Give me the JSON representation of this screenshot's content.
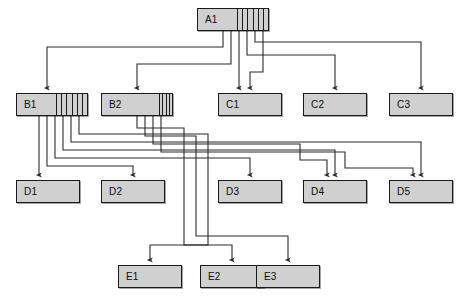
{
  "diagram": {
    "background_color": "#ffffff",
    "node_fill": "#d0d0d0",
    "node_stroke": "#1a1a1a",
    "edge_color": "#2b2b2b",
    "levels": [
      "A",
      "B",
      "C",
      "D",
      "E"
    ],
    "nodes": [
      {
        "id": "A1",
        "label": "A1",
        "x": 197,
        "y": 8,
        "w": 72,
        "h": 23,
        "ports": 6,
        "label_w": 26
      },
      {
        "id": "B1",
        "label": "B1",
        "x": 16,
        "y": 93,
        "w": 72,
        "h": 23,
        "ports": 6,
        "label_w": 26
      },
      {
        "id": "B2",
        "label": "B2",
        "x": 101,
        "y": 93,
        "w": 72,
        "h": 23,
        "ports": 4,
        "label_w": 44
      },
      {
        "id": "C1",
        "label": "C1",
        "x": 218,
        "y": 93,
        "w": 64,
        "h": 23,
        "ports": 0,
        "label_w": 0
      },
      {
        "id": "C2",
        "label": "C2",
        "x": 303,
        "y": 93,
        "w": 64,
        "h": 23,
        "ports": 0,
        "label_w": 0
      },
      {
        "id": "C3",
        "label": "C3",
        "x": 389,
        "y": 93,
        "w": 64,
        "h": 23,
        "ports": 0,
        "label_w": 0
      },
      {
        "id": "D1",
        "label": "D1",
        "x": 16,
        "y": 180,
        "w": 64,
        "h": 23,
        "ports": 0,
        "label_w": 0
      },
      {
        "id": "D2",
        "label": "D2",
        "x": 101,
        "y": 180,
        "w": 64,
        "h": 23,
        "ports": 0,
        "label_w": 0
      },
      {
        "id": "D3",
        "label": "D3",
        "x": 218,
        "y": 180,
        "w": 64,
        "h": 23,
        "ports": 0,
        "label_w": 0
      },
      {
        "id": "D4",
        "label": "D4",
        "x": 303,
        "y": 180,
        "w": 64,
        "h": 23,
        "ports": 0,
        "label_w": 0
      },
      {
        "id": "D5",
        "label": "D5",
        "x": 389,
        "y": 180,
        "w": 64,
        "h": 23,
        "ports": 0,
        "label_w": 0
      },
      {
        "id": "E1",
        "label": "E1",
        "x": 118,
        "y": 265,
        "w": 64,
        "h": 23,
        "ports": 0,
        "label_w": 0
      },
      {
        "id": "E2",
        "label": "E2",
        "x": 200,
        "y": 265,
        "w": 64,
        "h": 23,
        "ports": 0,
        "label_w": 0
      },
      {
        "id": "E3",
        "label": "E3",
        "x": 256,
        "y": 265,
        "w": 64,
        "h": 23,
        "ports": 0,
        "label_w": 0
      }
    ],
    "edges": [
      {
        "from": "A1",
        "to": "B1",
        "path": "M 223,31 L 223,47 L 47,47 L 47,88"
      },
      {
        "from": "A1",
        "to": "B2",
        "path": "M 231,31 L 231,64 L 137,64 L 137,88"
      },
      {
        "from": "A1",
        "to": "C1",
        "path": "M 239,31 L 239,88"
      },
      {
        "from": "A1",
        "to": "C2",
        "path": "M 247,31 L 247,55 L 335,55 L 335,88"
      },
      {
        "from": "A1",
        "to": "C3",
        "path": "M 255,31 L 255,42 L 421,42 L 421,88"
      },
      {
        "from": "A1",
        "to": "C1",
        "path": "M 263,31 L 263,72 L 250,72 L 250,88"
      },
      {
        "from": "B1",
        "to": "D1",
        "path": "M 39,116 L 39,175"
      },
      {
        "from": "B1",
        "to": "D2",
        "path": "M 47,116 L 47,166 L 133,166 L 133,175"
      },
      {
        "from": "B1",
        "to": "D3",
        "path": "M 55,116 L 55,158 L 250,158 L 250,175"
      },
      {
        "from": "B1",
        "to": "D4",
        "path": "M 63,116 L 63,150 L 335,150 L 335,175"
      },
      {
        "from": "B1",
        "to": "D5",
        "path": "M 71,116 L 71,142 L 421,142 L 421,175"
      },
      {
        "from": "B1",
        "to": "E1",
        "path": "M 79,116 L 79,134 L 208,134 L 208,245 L 150,245 L 150,260"
      },
      {
        "from": "B2",
        "to": "E2",
        "path": "M 137,116 L 137,128 L 184,128 L 184,245 L 232,245 L 232,260"
      },
      {
        "from": "B2",
        "to": "E3",
        "path": "M 145,116 L 145,136 L 196,136 L 196,236 L 288,236 L 288,260"
      },
      {
        "from": "B2",
        "to": "D4",
        "path": "M 153,116 L 153,144 L 300,144 L 300,160 L 327,160 L 327,175"
      },
      {
        "from": "B2",
        "to": "D5",
        "path": "M 161,116 L 161,152 L 345,152 L 345,168 L 413,168 L 413,175"
      }
    ]
  }
}
